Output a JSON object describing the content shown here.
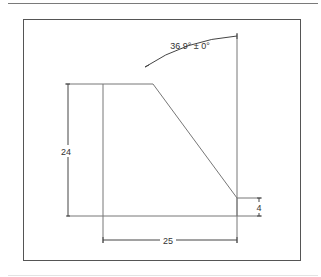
{
  "drawing": {
    "angle_label": "36.9° ± 0°",
    "height_label": "24",
    "width_label": "25",
    "offset_label": "4"
  },
  "colors": {
    "line": "#555555",
    "dim_line": "#444444",
    "text": "#333333"
  }
}
